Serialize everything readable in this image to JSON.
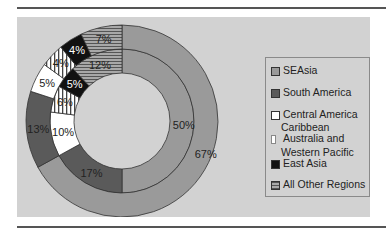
{
  "chart_data": {
    "type": "pie",
    "subtype": "doughnut",
    "title": "",
    "rings": [
      {
        "name": "inner",
        "values": [
          50,
          17,
          10,
          6,
          5,
          12
        ],
        "labels": [
          "50%",
          "17%",
          "10%",
          "6%",
          "5%",
          "12%"
        ]
      },
      {
        "name": "outer",
        "values": [
          67,
          13,
          5,
          4,
          4,
          7
        ],
        "labels": [
          "67%",
          "13%",
          "5%",
          "4%",
          "4%",
          "7%"
        ]
      }
    ],
    "categories": [
      "SEAsia",
      "South America",
      "Central America",
      "Australia and Western Pacific",
      "East Asia",
      "All Other Regions"
    ],
    "legend": [
      "SEAsia",
      "South America",
      "Central America",
      "Caribbean",
      "Australia and Western Pacific",
      "East Asia",
      "All Other Regions"
    ],
    "legend_position": "right",
    "colors": {
      "SEAsia": "#9a9a9a",
      "South America": "#5a5a5a",
      "Central America": "#ffffff",
      "Australia and Western Pacific": "vertical-stripes",
      "East Asia": "#111111",
      "All Other Regions": "horizontal-stripes"
    }
  },
  "legend": {
    "items": [
      {
        "label": "SEAsia"
      },
      {
        "label": "South America"
      },
      {
        "label": "Central America"
      },
      {
        "label": "Caribbean"
      },
      {
        "label": "Australia and"
      },
      {
        "label": "Western Pacific"
      },
      {
        "label": "East Asia"
      },
      {
        "label": "All Other Regions"
      }
    ]
  }
}
